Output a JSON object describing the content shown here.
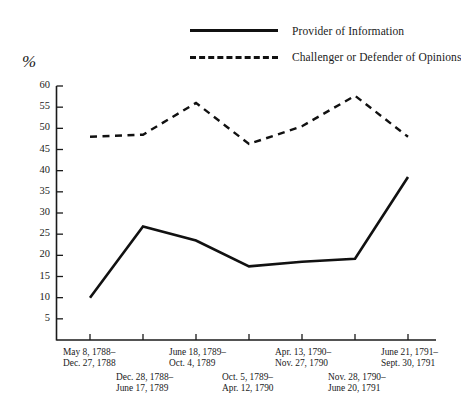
{
  "legend": {
    "items": [
      {
        "label": "Provider of Information",
        "style": "solid",
        "icon": "solid-line-swatch"
      },
      {
        "label": "Challenger or Defender of Opinions",
        "style": "dashed",
        "icon": "dashed-line-swatch"
      }
    ]
  },
  "axis": {
    "y_unit_label": "%",
    "y_ticks": [
      "60",
      "55",
      "50",
      "45",
      "40",
      "35",
      "30",
      "25",
      "20",
      "15",
      "10",
      "5"
    ]
  },
  "chart_data": {
    "type": "line",
    "title": "",
    "xlabel": "",
    "ylabel": "%",
    "ylim": [
      0,
      60
    ],
    "ytick_values": [
      5,
      10,
      15,
      20,
      25,
      30,
      35,
      40,
      45,
      50,
      55,
      60
    ],
    "grid": false,
    "legend_position": "top-right",
    "categories": [
      "May 8, 1788–\nDec. 27, 1788",
      "Dec. 28, 1788–\nJune 17, 1789",
      "June 18, 1789–\nOct. 4, 1789",
      "Oct. 5, 1789–\nApr. 12, 1790",
      "Apr. 13, 1790–\nNov. 27, 1790",
      "Nov. 28, 1790–\nJune 20, 1791",
      "June 21, 1791–\nSept. 30, 1791"
    ],
    "categories_lines": [
      [
        "May 8, 1788–",
        "Dec. 27, 1788"
      ],
      [
        "Dec. 28, 1788–",
        "June 17, 1789"
      ],
      [
        "June 18, 1789–",
        "Oct. 4, 1789"
      ],
      [
        "Oct. 5, 1789–",
        "Apr. 12, 1790"
      ],
      [
        "Apr. 13, 1790–",
        "Nov. 27, 1790"
      ],
      [
        "Nov. 28, 1790–",
        "June 20, 1791"
      ],
      [
        "June 21, 1791–",
        "Sept. 30, 1791"
      ]
    ],
    "series": [
      {
        "name": "Provider of Information",
        "style": "solid",
        "color": "#111111",
        "values": [
          10,
          26.8,
          23.5,
          17.4,
          18.5,
          19.2,
          38.5
        ]
      },
      {
        "name": "Challenger or Defender of Opinions",
        "style": "dashed",
        "color": "#111111",
        "values": [
          48,
          48.5,
          56,
          46.3,
          50.5,
          57.7,
          48
        ]
      }
    ]
  }
}
